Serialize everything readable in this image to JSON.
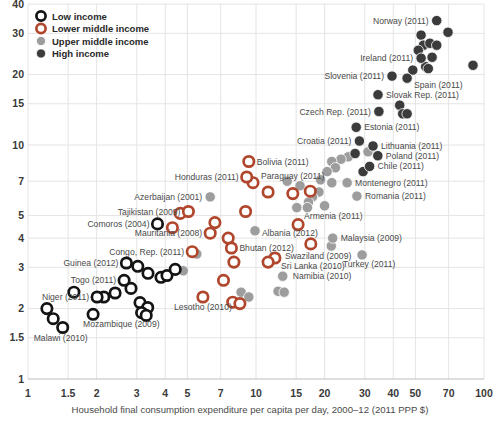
{
  "chart_data": {
    "type": "scatter",
    "title": "",
    "xlabel": "Household final consumption expenditure per capita per day, 2000–12 (2011 PPP $)",
    "ylabel": "",
    "x_scale": "log",
    "y_scale": "log",
    "x_range": [
      1,
      100
    ],
    "y_range": [
      1,
      41
    ],
    "grid": true,
    "x_ticks": [
      1,
      1.5,
      2,
      3,
      4,
      5,
      7,
      10,
      15,
      20,
      30,
      40,
      50,
      70,
      100
    ],
    "y_ticks": [
      1,
      1.5,
      2,
      3,
      4,
      5,
      7,
      10,
      15,
      20,
      30,
      40
    ],
    "legend": {
      "position": "top-left",
      "items": [
        {
          "label": "Low income",
          "group": "low",
          "style": "ring",
          "color": "#141414"
        },
        {
          "label": "Lower middle income",
          "group": "lower",
          "style": "ring",
          "color": "#b0462b"
        },
        {
          "label": "Upper middle income",
          "group": "upper",
          "style": "fill",
          "color": "#9d9d9d"
        },
        {
          "label": "High income",
          "group": "high",
          "style": "fill",
          "color": "#3b3b3b"
        }
      ]
    },
    "points": [
      {
        "x": 31.0,
        "y": 9.35,
        "g": "upper"
      },
      {
        "x": 25.4,
        "y": 8.9,
        "g": "upper"
      },
      {
        "x": 23.6,
        "y": 8.7,
        "g": "upper"
      },
      {
        "x": 21.5,
        "y": 8.5,
        "g": "upper"
      },
      {
        "x": 22.3,
        "y": 8.0,
        "g": "upper"
      },
      {
        "x": 20.5,
        "y": 7.7,
        "g": "upper"
      },
      {
        "x": 19.2,
        "y": 7.1,
        "g": "upper"
      },
      {
        "x": 21.5,
        "y": 6.9,
        "g": "upper"
      },
      {
        "x": 15.6,
        "y": 6.7,
        "g": "upper"
      },
      {
        "x": 13.7,
        "y": 7.0,
        "g": "upper"
      },
      {
        "x": 18.9,
        "y": 6.3,
        "g": "upper"
      },
      {
        "x": 17.7,
        "y": 6.0,
        "g": "upper"
      },
      {
        "x": 17.0,
        "y": 5.7,
        "g": "upper"
      },
      {
        "x": 20.0,
        "y": 5.5,
        "g": "upper"
      },
      {
        "x": 15.1,
        "y": 5.4,
        "g": "upper"
      },
      {
        "x": 16.8,
        "y": 5.4,
        "g": "upper"
      },
      {
        "x": 15.1,
        "y": 4.5,
        "g": "upper"
      },
      {
        "x": 9.9,
        "y": 4.3,
        "g": "upper"
      },
      {
        "x": 21.4,
        "y": 3.7,
        "g": "upper"
      },
      {
        "x": 12.5,
        "y": 2.37,
        "g": "upper"
      },
      {
        "x": 13.3,
        "y": 2.35,
        "g": "upper"
      },
      {
        "x": 8.6,
        "y": 2.35,
        "g": "upper"
      },
      {
        "x": 9.3,
        "y": 2.24,
        "g": "upper"
      },
      {
        "x": 4.8,
        "y": 2.9,
        "g": "upper"
      },
      {
        "x": 5.5,
        "y": 3.42,
        "g": "upper"
      },
      {
        "x": 6.3,
        "y": 6.0,
        "g": "upper",
        "label": "Azerbaijan (2001)",
        "anchor": "end",
        "dx": -8,
        "dy": 3
      },
      {
        "x": 25.1,
        "y": 6.9,
        "g": "upper",
        "label": "Montenegro (2011)",
        "anchor": "start",
        "dx": 8,
        "dy": 3
      },
      {
        "x": 27.7,
        "y": 6.05,
        "g": "upper",
        "label": "Romania (2011)",
        "anchor": "start",
        "dx": 8,
        "dy": 3
      },
      {
        "x": 13.1,
        "y": 2.75,
        "g": "upper",
        "label": "Namibia (2010)",
        "anchor": "start",
        "dx": 10,
        "dy": 3
      },
      {
        "x": 21.7,
        "y": 4.0,
        "g": "upper",
        "label": "Malaysia (2009)",
        "anchor": "start",
        "dx": 8,
        "dy": 3
      },
      {
        "x": 29.2,
        "y": 3.39,
        "g": "upper",
        "label": "Turkey (2011)",
        "anchor": "middle",
        "dx": 7,
        "dy": 12
      },
      {
        "x": 69.5,
        "y": 30.3,
        "g": "high"
      },
      {
        "x": 53.0,
        "y": 29.5,
        "g": "high"
      },
      {
        "x": 54.2,
        "y": 26.7,
        "g": "high"
      },
      {
        "x": 57.9,
        "y": 27.2,
        "g": "high"
      },
      {
        "x": 62.0,
        "y": 26.7,
        "g": "high"
      },
      {
        "x": 51.5,
        "y": 25.4,
        "g": "high"
      },
      {
        "x": 59.2,
        "y": 23.7,
        "g": "high"
      },
      {
        "x": 55.5,
        "y": 21.6,
        "g": "high"
      },
      {
        "x": 57.0,
        "y": 21.2,
        "g": "high"
      },
      {
        "x": 48.7,
        "y": 20.9,
        "g": "high"
      },
      {
        "x": 89.5,
        "y": 21.9,
        "g": "high"
      },
      {
        "x": 42.7,
        "y": 14.8,
        "g": "high"
      },
      {
        "x": 44.0,
        "y": 13.6,
        "g": "high"
      },
      {
        "x": 46.0,
        "y": 13.6,
        "g": "high"
      },
      {
        "x": 27.2,
        "y": 9.2,
        "g": "high"
      },
      {
        "x": 29.5,
        "y": 7.7,
        "g": "high"
      },
      {
        "x": 62.0,
        "y": 34.0,
        "g": "high",
        "label": "Norway (2011)",
        "anchor": "end",
        "dx": -8,
        "dy": 3
      },
      {
        "x": 53.0,
        "y": 23.5,
        "g": "high",
        "label": "Ireland (2011)",
        "anchor": "end",
        "dx": -8,
        "dy": 3
      },
      {
        "x": 39.5,
        "y": 19.7,
        "g": "high",
        "label": "Slovenia (2011)",
        "anchor": "end",
        "dx": -8,
        "dy": 3
      },
      {
        "x": 46.0,
        "y": 19.3,
        "g": "high",
        "label": "Spain (2011)",
        "anchor": "start",
        "dx": 7,
        "dy": 10
      },
      {
        "x": 34.3,
        "y": 16.4,
        "g": "high",
        "label": "Slovak Rep. (2011)",
        "anchor": "start",
        "dx": 8,
        "dy": 3
      },
      {
        "x": 34.6,
        "y": 13.9,
        "g": "high",
        "label": "Czech Rep. (2011)",
        "anchor": "end",
        "dx": -8,
        "dy": 3
      },
      {
        "x": 27.5,
        "y": 11.9,
        "g": "high",
        "label": "Estonia (2011)",
        "anchor": "start",
        "dx": 8,
        "dy": 3
      },
      {
        "x": 28.4,
        "y": 10.4,
        "g": "high",
        "label": "Croatia (2011)",
        "anchor": "end",
        "dx": -8,
        "dy": 3
      },
      {
        "x": 32.6,
        "y": 9.9,
        "g": "high",
        "label": "Lithuania (2011)",
        "anchor": "start",
        "dx": 8,
        "dy": 3
      },
      {
        "x": 34.2,
        "y": 9.0,
        "g": "high",
        "label": "Poland (2011)",
        "anchor": "start",
        "dx": 8,
        "dy": 3
      },
      {
        "x": 31.5,
        "y": 8.1,
        "g": "high",
        "label": "Chile (2011)",
        "anchor": "start",
        "dx": 8,
        "dy": 3
      },
      {
        "x": 11.3,
        "y": 6.3,
        "g": "lower"
      },
      {
        "x": 14.5,
        "y": 6.2,
        "g": "lower"
      },
      {
        "x": 17.3,
        "y": 6.35,
        "g": "lower"
      },
      {
        "x": 9.0,
        "y": 5.2,
        "g": "lower"
      },
      {
        "x": 6.6,
        "y": 4.66,
        "g": "lower"
      },
      {
        "x": 7.55,
        "y": 4.0,
        "g": "lower"
      },
      {
        "x": 8.0,
        "y": 3.16,
        "g": "lower"
      },
      {
        "x": 7.2,
        "y": 2.64,
        "g": "lower"
      },
      {
        "x": 7.9,
        "y": 2.13,
        "g": "lower"
      },
      {
        "x": 8.5,
        "y": 2.1,
        "g": "lower"
      },
      {
        "x": 4.3,
        "y": 4.43,
        "g": "lower"
      },
      {
        "x": 4.65,
        "y": 5.1,
        "g": "lower"
      },
      {
        "x": 9.3,
        "y": 8.5,
        "g": "lower",
        "label": "Bolivia (2011)",
        "anchor": "start",
        "dx": 8,
        "dy": 3
      },
      {
        "x": 9.7,
        "y": 6.9,
        "g": "lower",
        "label": "Paraguay (2011)",
        "anchor": "start",
        "dx": 8,
        "dy": -4
      },
      {
        "x": 9.1,
        "y": 7.3,
        "g": "lower",
        "label": "Honduras (2011)",
        "anchor": "end",
        "dx": -8,
        "dy": 3
      },
      {
        "x": 5.05,
        "y": 5.2,
        "g": "lower",
        "label": "Tajikistan (2009)",
        "anchor": "end",
        "dx": -8,
        "dy": 3
      },
      {
        "x": 6.3,
        "y": 4.2,
        "g": "lower",
        "label": "Mauritania (2008)",
        "anchor": "end",
        "dx": -8,
        "dy": 3
      },
      {
        "x": 5.25,
        "y": 3.5,
        "g": "lower",
        "label": "Congo, Rep. (2011)",
        "anchor": "end",
        "dx": -8,
        "dy": 3
      },
      {
        "x": 5.85,
        "y": 2.24,
        "g": "lower",
        "label": "Lesotho (2010)",
        "anchor": "middle",
        "dx": 0,
        "dy": 13
      },
      {
        "x": 7.8,
        "y": 3.63,
        "g": "lower",
        "label": "Bhutan (2012)",
        "anchor": "start",
        "dx": 8,
        "dy": 3
      },
      {
        "x": 15.3,
        "y": 4.57,
        "g": "lower",
        "label": "Armenia (2011)",
        "anchor": "start",
        "dx": 6,
        "dy": -6
      },
      {
        "x": 17.4,
        "y": 3.78,
        "g": "lower",
        "label": "Albania (2012)",
        "anchor": "end",
        "dx": 7,
        "dy": -8
      },
      {
        "x": 12.1,
        "y": 3.29,
        "g": "lower",
        "label": "Swaziland (2009)",
        "anchor": "start",
        "dx": 10,
        "dy": 1
      },
      {
        "x": 11.3,
        "y": 3.16,
        "g": "lower",
        "label": "Sri Lanka (2010)",
        "anchor": "start",
        "dx": 13,
        "dy": 7
      },
      {
        "x": 3.03,
        "y": 3.03,
        "g": "low"
      },
      {
        "x": 3.36,
        "y": 2.83,
        "g": "low"
      },
      {
        "x": 2.83,
        "y": 2.44,
        "g": "low"
      },
      {
        "x": 2.41,
        "y": 2.33,
        "g": "low"
      },
      {
        "x": 2.15,
        "y": 2.24,
        "g": "low"
      },
      {
        "x": 1.59,
        "y": 2.35,
        "g": "low"
      },
      {
        "x": 1.21,
        "y": 2.0,
        "g": "low"
      },
      {
        "x": 1.29,
        "y": 1.81,
        "g": "low"
      },
      {
        "x": 3.1,
        "y": 2.12,
        "g": "low"
      },
      {
        "x": 3.35,
        "y": 2.02,
        "g": "low"
      },
      {
        "x": 3.15,
        "y": 1.92,
        "g": "low"
      },
      {
        "x": 3.3,
        "y": 1.87,
        "g": "low"
      },
      {
        "x": 3.83,
        "y": 2.72,
        "g": "low"
      },
      {
        "x": 4.07,
        "y": 2.77,
        "g": "low"
      },
      {
        "x": 4.42,
        "y": 2.94,
        "g": "low"
      },
      {
        "x": 3.7,
        "y": 4.6,
        "g": "low",
        "label": "Comoros (2004)",
        "anchor": "end",
        "dx": -8,
        "dy": 3
      },
      {
        "x": 2.7,
        "y": 3.13,
        "g": "low",
        "label": "Guinea (2012)",
        "anchor": "end",
        "dx": -8,
        "dy": 3
      },
      {
        "x": 2.64,
        "y": 2.64,
        "g": "low",
        "label": "Togo (2011)",
        "anchor": "end",
        "dx": -8,
        "dy": 3
      },
      {
        "x": 2.01,
        "y": 2.24,
        "g": "low",
        "label": "Niger (2011)",
        "anchor": "end",
        "dx": -8,
        "dy": 3
      },
      {
        "x": 1.93,
        "y": 1.89,
        "g": "low",
        "label": "Mozambique (2009)",
        "anchor": "start",
        "dx": -10,
        "dy": 13
      },
      {
        "x": 1.42,
        "y": 1.66,
        "g": "low",
        "label": "Malawi (2010)",
        "anchor": "middle",
        "dx": -2,
        "dy": 13
      }
    ]
  }
}
